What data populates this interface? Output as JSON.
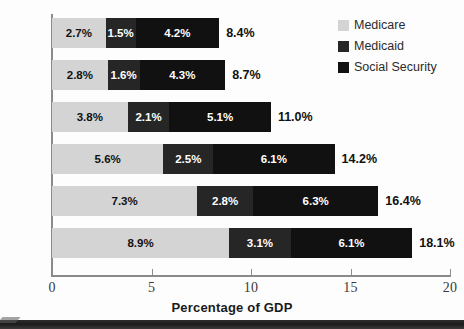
{
  "chart_data": {
    "type": "bar",
    "orientation": "horizontal",
    "stacked": true,
    "title": "",
    "xlabel": "Percentage of GDP",
    "ylabel": "",
    "xlim": [
      0,
      20
    ],
    "xticks": [
      0,
      5,
      10,
      15,
      20
    ],
    "xtick_labels": [
      "0",
      "5",
      "10",
      "15",
      "20"
    ],
    "grid": false,
    "legend_position": "top-right",
    "categories": [
      "2005",
      "2010",
      "2020",
      "2030",
      "2040",
      "2050"
    ],
    "series": [
      {
        "name": "Medicare",
        "color": "#d4d4d4",
        "values": [
          2.7,
          2.8,
          3.8,
          5.6,
          7.3,
          8.9
        ],
        "labels": [
          "2.7%",
          "2.8%",
          "3.8%",
          "5.6%",
          "7.3%",
          "8.9%"
        ]
      },
      {
        "name": "Medicaid",
        "color": "#262626",
        "values": [
          1.5,
          1.6,
          2.1,
          2.5,
          2.8,
          3.1
        ],
        "labels": [
          "1.5%",
          "1.6%",
          "2.1%",
          "2.5%",
          "2.8%",
          "3.1%"
        ]
      },
      {
        "name": "Social Security",
        "color": "#111111",
        "values": [
          4.2,
          4.3,
          5.1,
          6.1,
          6.3,
          6.1
        ],
        "labels": [
          "4.2%",
          "4.3%",
          "5.1%",
          "6.1%",
          "6.3%",
          "6.1%"
        ]
      }
    ],
    "totals": [
      8.4,
      8.7,
      11.0,
      14.2,
      16.4,
      18.1
    ],
    "total_labels": [
      "8.4%",
      "8.7%",
      "11.0%",
      "14.2%",
      "16.4%",
      "18.1%"
    ]
  },
  "legend": {
    "items": [
      {
        "label": "Medicare",
        "color": "#d4d4d4"
      },
      {
        "label": "Medicaid",
        "color": "#262626"
      },
      {
        "label": "Social Security",
        "color": "#111111"
      }
    ]
  },
  "axis": {
    "x_title": "Percentage of GDP"
  },
  "colors": {
    "medicare": "#d4d4d4",
    "medicaid": "#262626",
    "social_security": "#111111",
    "axis": "#8b8b8b",
    "text": "#1a1a1a",
    "background": "#fdfdfd"
  }
}
